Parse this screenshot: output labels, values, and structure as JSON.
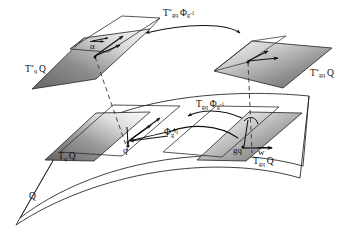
{
  "figure": {
    "domain_note": "differential geometry diagram"
  },
  "labels": {
    "cotangent_left": {
      "base": "T",
      "star": "*",
      "sub": "q",
      "space": "Q",
      "full": "T*qQ"
    },
    "cotangent_right": {
      "base": "T",
      "star": "*",
      "sub": "gq",
      "space": "Q",
      "full": "T*gqQ"
    },
    "tangent_left": {
      "base": "T",
      "sub": "q",
      "space": "Q",
      "full": "TqQ"
    },
    "tangent_right": {
      "base": "T",
      "sub": "gq",
      "space": "Q",
      "full": "TgqQ"
    },
    "cotangent_lift_map": {
      "base": "T",
      "star": "*",
      "sub": "gq",
      "phi": "Φ",
      "phi_sub": "g",
      "phi_exp": "-1",
      "full": "T*gq Φg-1"
    },
    "tangent_lift_map": {
      "base": "T",
      "sub": "gq",
      "phi": "Φ",
      "phi_sub": "g",
      "phi_exp": "-1",
      "full": "Tgq Φg-1"
    },
    "base_map": {
      "phi": "Φ",
      "phi_sub": "g",
      "phi_exp": "-1",
      "full": "Φg-1"
    },
    "manifold": {
      "text": "Q"
    },
    "point_q": {
      "text": "q"
    },
    "point_gq": {
      "text": "gq"
    },
    "covector_alpha": {
      "text": "α",
      "has_vector_arrow": true
    },
    "vector_w": {
      "text": "w",
      "has_vector_arrow": true
    }
  },
  "icons": {
    "vector_arrow": "vector-arrow-icon",
    "curved_arrow": "curved-arrow-icon",
    "dashed_projection": "dashed-projection-line-icon"
  },
  "colors": {
    "stroke": "#1a1a1a",
    "plane_dark": "#6e6e6e",
    "plane_mid": "#9e9e9e",
    "plane_light": "#f2f2f2",
    "background": "#ffffff",
    "text": "#111111"
  },
  "geometry": {
    "cotangent_left_plane": "32,88 93,31 152,29 97,77",
    "cotangent_left_plane_outline": "75,45 152,29 97,77",
    "cotangent_right_plane": "215,70 252,41 332,48 283,88",
    "tangent_left_plane": "43,161 95,113 148,112 93,160",
    "tangent_right_plane": "196,160 248,112 300,113 245,161",
    "surface_top_edge": "top-curved-band",
    "surface_bottom_edge": "bottom-curved-band"
  }
}
